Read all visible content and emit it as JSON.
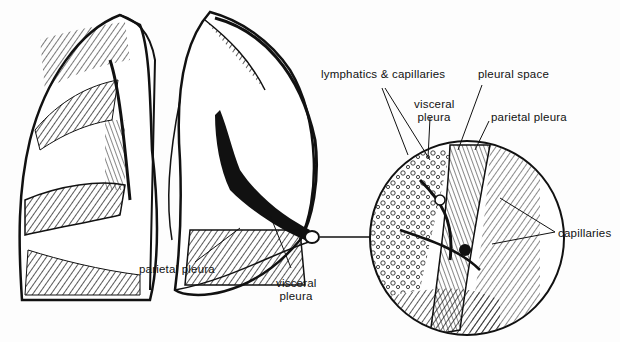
{
  "diagram": {
    "labels": {
      "lymphatics_capillaries": "lymphatics & capillaries",
      "pleural_space": "pleural space",
      "visceral_pleura_top_1": "visceral",
      "visceral_pleura_top_2": "pleura",
      "parietal_pleura_top": "parietal pleura",
      "capillaries": "capillaries",
      "parietal_pleura_bottom": "parietal pleura",
      "visceral_pleura_bottom_1": "visceral",
      "visceral_pleura_bottom_2": "pleura"
    },
    "colors": {
      "ink": "#111111",
      "background": "#fdfdfd"
    }
  }
}
